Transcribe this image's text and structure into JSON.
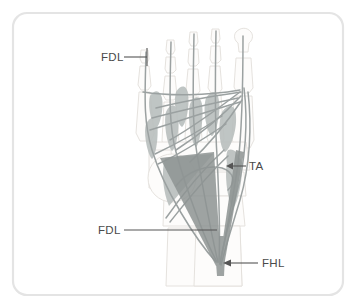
{
  "figure": {
    "frame": {
      "border_color": "#e3e3e3",
      "background_color": "#ffffff",
      "corner_radius": 14
    },
    "palette": {
      "bone_outline": "#e0ddd8",
      "bone_fill": "#fcfbfa",
      "muscle_fill": "#b8bdbd",
      "tendon_stroke": "#9aa0a0",
      "tendon_dark": "#8d9392",
      "label_text": "#4a4a4a",
      "leader_line": "#555555"
    },
    "labels": [
      {
        "id": "fdl-top",
        "text": "FDL",
        "name": "label-fdl-proximal",
        "x": 101,
        "y": 61,
        "leader": {
          "x1": 124,
          "y1": 57,
          "x2": 147,
          "y2": 57
        },
        "tick": {
          "x": 147,
          "y1": 48,
          "y2": 66
        }
      },
      {
        "id": "ta",
        "text": "TA",
        "name": "label-ta",
        "x": 249,
        "y": 170,
        "leader": {
          "x1": 246,
          "y1": 166,
          "x2": 228,
          "y2": 166
        },
        "arrow": {
          "x": 228,
          "y": 166,
          "dir": "left"
        }
      },
      {
        "id": "fdl-bottom",
        "text": "FDL",
        "name": "label-fdl-distal",
        "x": 98,
        "y": 234,
        "leader": {
          "x1": 124,
          "y1": 230,
          "x2": 217,
          "y2": 230
        }
      },
      {
        "id": "fhl",
        "text": "FHL",
        "name": "label-fhl",
        "x": 262,
        "y": 267,
        "leader": {
          "x1": 258,
          "y1": 263,
          "x2": 224,
          "y2": 263
        },
        "arrow": {
          "x": 224,
          "y": 263,
          "dir": "left"
        }
      }
    ],
    "legend_meaning": {
      "FDL": "Flexor digitorum longus",
      "FHL": "Flexor hallucis longus",
      "TA": "Tibialis anterior"
    }
  }
}
